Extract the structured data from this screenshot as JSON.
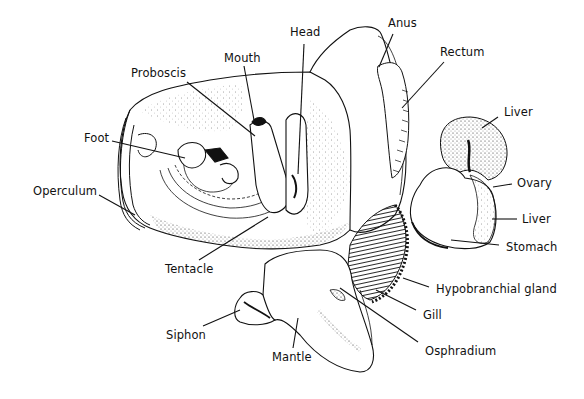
{
  "diagram": {
    "ink_color": "#111111",
    "background": "#ffffff",
    "labels": [
      {
        "id": "head",
        "text": "Head",
        "x": 290,
        "y": 27
      },
      {
        "id": "anus",
        "text": "Anus",
        "x": 388,
        "y": 18
      },
      {
        "id": "mouth",
        "text": "Mouth",
        "x": 224,
        "y": 53
      },
      {
        "id": "rectum",
        "text": "Rectum",
        "x": 440,
        "y": 47
      },
      {
        "id": "proboscis",
        "text": "Proboscis",
        "x": 131,
        "y": 68
      },
      {
        "id": "liver-upper",
        "text": "Liver",
        "x": 504,
        "y": 107
      },
      {
        "id": "foot",
        "text": "Foot",
        "x": 84,
        "y": 133
      },
      {
        "id": "operculum",
        "text": "Operculum",
        "x": 33,
        "y": 186
      },
      {
        "id": "ovary",
        "text": "Ovary",
        "x": 517,
        "y": 178
      },
      {
        "id": "liver-lower",
        "text": "Liver",
        "x": 522,
        "y": 214
      },
      {
        "id": "stomach",
        "text": "Stomach",
        "x": 506,
        "y": 242
      },
      {
        "id": "tentacle",
        "text": "Tentacle",
        "x": 165,
        "y": 264
      },
      {
        "id": "hypobranchial-gland",
        "text": "Hypobranchial gland",
        "x": 436,
        "y": 284
      },
      {
        "id": "gill",
        "text": "Gill",
        "x": 423,
        "y": 310
      },
      {
        "id": "siphon",
        "text": "Siphon",
        "x": 166,
        "y": 330
      },
      {
        "id": "mantle",
        "text": "Mantle",
        "x": 272,
        "y": 352
      },
      {
        "id": "osphradium",
        "text": "Osphradium",
        "x": 425,
        "y": 346
      }
    ],
    "leader_lines": [
      {
        "to": "head",
        "x1": 304,
        "y1": 44,
        "x2": 298,
        "y2": 174
      },
      {
        "to": "anus",
        "x1": 393,
        "y1": 34,
        "x2": 379,
        "y2": 67
      },
      {
        "to": "mouth",
        "x1": 244,
        "y1": 66,
        "x2": 254,
        "y2": 120
      },
      {
        "to": "rectum",
        "x1": 444,
        "y1": 62,
        "x2": 402,
        "y2": 108
      },
      {
        "to": "proboscis",
        "x1": 187,
        "y1": 82,
        "x2": 255,
        "y2": 136
      },
      {
        "to": "liver-upper",
        "x1": 498,
        "y1": 117,
        "x2": 482,
        "y2": 128
      },
      {
        "to": "foot",
        "x1": 112,
        "y1": 141,
        "x2": 185,
        "y2": 158
      },
      {
        "to": "operculum",
        "x1": 99,
        "y1": 195,
        "x2": 135,
        "y2": 215
      },
      {
        "to": "ovary",
        "x1": 512,
        "y1": 184,
        "x2": 493,
        "y2": 187
      },
      {
        "to": "liver-lower",
        "x1": 517,
        "y1": 219,
        "x2": 492,
        "y2": 219
      },
      {
        "to": "stomach",
        "x1": 499,
        "y1": 245,
        "x2": 451,
        "y2": 240
      },
      {
        "to": "tentacle",
        "x1": 199,
        "y1": 260,
        "x2": 268,
        "y2": 217
      },
      {
        "to": "hypobranchial-gland",
        "x1": 429,
        "y1": 287,
        "x2": 403,
        "y2": 278
      },
      {
        "to": "gill",
        "x1": 416,
        "y1": 310,
        "x2": 376,
        "y2": 290
      },
      {
        "to": "siphon",
        "x1": 203,
        "y1": 326,
        "x2": 240,
        "y2": 310
      },
      {
        "to": "mantle",
        "x1": 293,
        "y1": 348,
        "x2": 298,
        "y2": 318
      },
      {
        "to": "osphradium",
        "x1": 418,
        "y1": 342,
        "x2": 340,
        "y2": 288
      }
    ]
  }
}
